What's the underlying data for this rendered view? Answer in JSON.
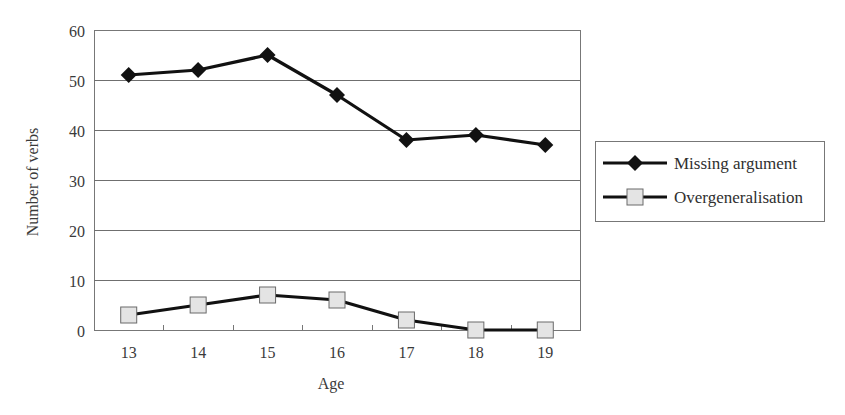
{
  "chart_data": {
    "type": "line",
    "title": "",
    "xlabel": "Age",
    "ylabel": "Number of verbs",
    "categories": [
      "13",
      "14",
      "15",
      "16",
      "17",
      "18",
      "19"
    ],
    "ylim": [
      0,
      60
    ],
    "yticks": [
      0,
      10,
      20,
      30,
      40,
      50,
      60
    ],
    "grid": true,
    "legend_position": "right",
    "series": [
      {
        "name": "Missing argument",
        "marker": "diamond",
        "color": "#111111",
        "marker_fill": "#111111",
        "values": [
          51,
          52,
          55,
          47,
          38,
          39,
          37
        ]
      },
      {
        "name": "Overgeneralisation",
        "marker": "square",
        "color": "#111111",
        "marker_fill": "#e4e4e4",
        "values": [
          3,
          5,
          7,
          6,
          2,
          0,
          0
        ]
      }
    ]
  },
  "colors": {
    "gridline": "#6f6f6f",
    "frame": "#777777",
    "text": "#3a3a3a",
    "line": "#111111",
    "square_fill": "#e4e4e4",
    "square_stroke": "#6a6a6a"
  }
}
